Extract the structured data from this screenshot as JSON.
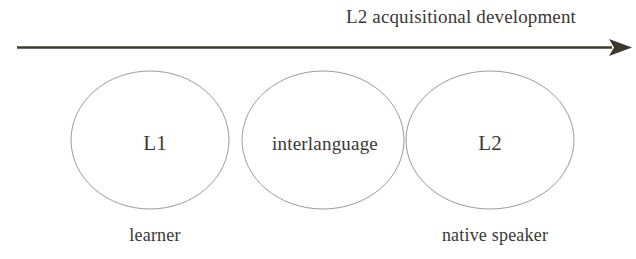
{
  "figure": {
    "title": "L2 acquisitional development",
    "background_color": "#ffffff",
    "text_color": "#3b3833",
    "arrow": {
      "name": "progression-arrow",
      "color": "#3f382f",
      "direction": "left-to-right"
    },
    "stages": [
      {
        "id": "l1",
        "label": "L1",
        "caption": "learner",
        "circle_color": "#9a9a96"
      },
      {
        "id": "interlanguage",
        "label": "interlanguage",
        "caption": "",
        "circle_color": "#9a9a96"
      },
      {
        "id": "l2",
        "label": "L2",
        "caption": "native speaker",
        "circle_color": "#9a9a96"
      }
    ]
  }
}
